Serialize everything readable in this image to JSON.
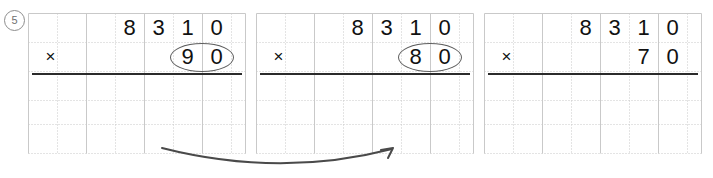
{
  "worksheet": {
    "item_number": "5",
    "item_number_display": "⑤",
    "multiply_sign": "×",
    "problems": [
      {
        "id": "problem-1",
        "multiplicand": [
          "8",
          "3",
          "1",
          "0"
        ],
        "multiplier": [
          "9",
          "0"
        ],
        "multiplier_circled": true,
        "operator": "×"
      },
      {
        "id": "problem-2",
        "multiplicand": [
          "8",
          "3",
          "1",
          "0"
        ],
        "multiplier": [
          "8",
          "0"
        ],
        "multiplier_circled": true,
        "operator": "×"
      },
      {
        "id": "problem-3",
        "multiplicand": [
          "8",
          "3",
          "1",
          "0"
        ],
        "multiplier": [
          "7",
          "0"
        ],
        "multiplier_circled": false,
        "operator": "×"
      }
    ],
    "annotation": {
      "arrow": "curved-arrow-right",
      "arrow_direction": "right"
    },
    "colors": {
      "ink": "#111111",
      "grid_line": "#c9c9c9",
      "rule": "#2b2b2b",
      "annotation": "#5e5e5e"
    }
  }
}
